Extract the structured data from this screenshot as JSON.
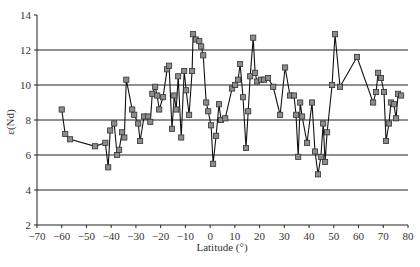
{
  "chart_data": {
    "type": "line",
    "title": "",
    "xlabel": "Latitude (°)",
    "ylabel": "ε(Nd)",
    "xlim": [
      -70,
      80
    ],
    "ylim": [
      2,
      14
    ],
    "x_ticks": [
      -70,
      -60,
      -50,
      -40,
      -30,
      -20,
      -10,
      0,
      10,
      20,
      30,
      40,
      50,
      60,
      70,
      80
    ],
    "y_ticks": [
      2,
      4,
      6,
      8,
      10,
      12,
      14
    ],
    "grid": {
      "horizontal": [
        4,
        6,
        8,
        10,
        12
      ],
      "vertical": false
    },
    "legend": null,
    "marker": "square",
    "marker_color": "#8c8c8c",
    "line_color": "#111111",
    "series": [
      {
        "name": "ε(Nd)",
        "points": [
          [
            -60.0,
            8.6
          ],
          [
            -58.6,
            7.2
          ],
          [
            -56.6,
            6.9
          ],
          [
            -46.5,
            6.5
          ],
          [
            -42.4,
            6.7
          ],
          [
            -41.2,
            5.3
          ],
          [
            -40.4,
            7.4
          ],
          [
            -38.8,
            7.8
          ],
          [
            -37.6,
            6.0
          ],
          [
            -36.8,
            6.3
          ],
          [
            -35.6,
            7.3
          ],
          [
            -34.7,
            7.0
          ],
          [
            -33.9,
            10.3
          ],
          [
            -31.5,
            8.6
          ],
          [
            -30.7,
            8.3
          ],
          [
            -29.1,
            7.8
          ],
          [
            -28.3,
            6.8
          ],
          [
            -26.7,
            8.2
          ],
          [
            -25.1,
            8.2
          ],
          [
            -24.2,
            7.9
          ],
          [
            -23.4,
            9.5
          ],
          [
            -22.2,
            9.9
          ],
          [
            -21.4,
            9.4
          ],
          [
            -20.6,
            8.6
          ],
          [
            -19.0,
            9.3
          ],
          [
            -17.4,
            10.9
          ],
          [
            -16.6,
            11.1
          ],
          [
            -15.4,
            7.5
          ],
          [
            -14.5,
            9.4
          ],
          [
            -13.7,
            8.6
          ],
          [
            -12.9,
            10.5
          ],
          [
            -11.7,
            7.0
          ],
          [
            -10.5,
            10.8
          ],
          [
            -9.7,
            9.7
          ],
          [
            -8.5,
            8.3
          ],
          [
            -7.3,
            10.8
          ],
          [
            -6.9,
            12.9
          ],
          [
            -5.7,
            12.6
          ],
          [
            -4.4,
            12.5
          ],
          [
            -3.6,
            12.2
          ],
          [
            -2.8,
            11.7
          ],
          [
            -1.6,
            9.0
          ],
          [
            -0.8,
            8.5
          ],
          [
            0.4,
            7.7
          ],
          [
            1.2,
            5.5
          ],
          [
            2.4,
            7.1
          ],
          [
            3.6,
            8.9
          ],
          [
            4.4,
            8.0
          ],
          [
            6.1,
            8.1
          ],
          [
            8.9,
            9.8
          ],
          [
            10.1,
            10.0
          ],
          [
            11.3,
            10.3
          ],
          [
            12.1,
            11.2
          ],
          [
            13.3,
            9.3
          ],
          [
            14.5,
            6.4
          ],
          [
            15.4,
            8.5
          ],
          [
            16.2,
            10.5
          ],
          [
            17.4,
            12.7
          ],
          [
            18.2,
            10.7
          ],
          [
            19.0,
            10.2
          ],
          [
            20.6,
            10.3
          ],
          [
            21.8,
            10.3
          ],
          [
            23.4,
            10.4
          ],
          [
            25.5,
            9.9
          ],
          [
            28.3,
            8.3
          ],
          [
            30.3,
            11.0
          ],
          [
            32.3,
            9.4
          ],
          [
            33.9,
            9.4
          ],
          [
            34.7,
            8.3
          ],
          [
            35.6,
            5.9
          ],
          [
            36.4,
            9.0
          ],
          [
            37.2,
            8.2
          ],
          [
            39.2,
            6.7
          ],
          [
            41.2,
            9.0
          ],
          [
            42.4,
            6.2
          ],
          [
            43.6,
            4.9
          ],
          [
            44.8,
            5.9
          ],
          [
            45.7,
            7.8
          ],
          [
            46.5,
            5.6
          ],
          [
            47.3,
            7.3
          ],
          [
            49.3,
            10.0
          ],
          [
            50.5,
            12.9
          ],
          [
            52.5,
            9.9
          ],
          [
            59.4,
            11.6
          ],
          [
            65.9,
            9.0
          ],
          [
            67.1,
            9.6
          ],
          [
            67.9,
            10.7
          ],
          [
            69.1,
            10.4
          ],
          [
            70.3,
            9.6
          ],
          [
            71.1,
            6.8
          ],
          [
            72.3,
            7.8
          ],
          [
            73.1,
            9.0
          ],
          [
            74.3,
            8.9
          ],
          [
            75.2,
            8.1
          ],
          [
            76.0,
            9.5
          ],
          [
            77.2,
            9.4
          ]
        ]
      }
    ]
  },
  "layout": {
    "plot_left": 37,
    "plot_right": 408,
    "plot_top": 15,
    "plot_bottom": 225
  }
}
